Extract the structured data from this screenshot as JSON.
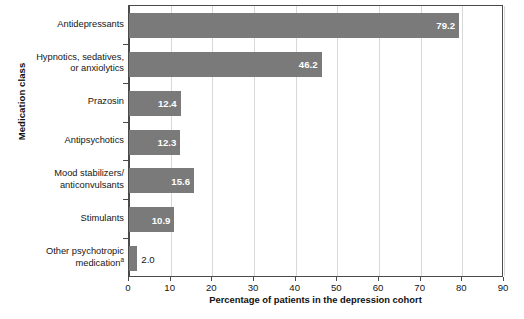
{
  "chart_data": {
    "type": "bar",
    "orientation": "horizontal",
    "title": "",
    "xlabel": "Percentage of patients in the depression cohort",
    "ylabel": "Medication class",
    "xlim": [
      0,
      90
    ],
    "xticks": [
      0,
      10,
      20,
      30,
      40,
      50,
      60,
      70,
      80,
      90
    ],
    "grid": "vertical",
    "legend": "none",
    "bar_color": "#7a7a7a",
    "categories": [
      "Antidepressants",
      "Hypnotics, sedatives, or anxiolytics",
      "Prazosin",
      "Antipsychotics",
      "Mood stabilizers/ anticonvulsants",
      "Stimulants",
      "Other psychotropic medication"
    ],
    "values": [
      79.2,
      46.2,
      12.4,
      12.3,
      15.6,
      10.9,
      2.0
    ],
    "value_labels": [
      "79.2",
      "46.2",
      "12.4",
      "12.3",
      "15.6",
      "10.9",
      "2.0"
    ],
    "bars": [
      {
        "category": "Antidepressants",
        "value": 79.2,
        "label": "79.2",
        "label_position": "inside"
      },
      {
        "category": "Hypnotics, sedatives, or anxiolytics",
        "value": 46.2,
        "label": "46.2",
        "label_position": "inside"
      },
      {
        "category": "Prazosin",
        "value": 12.4,
        "label": "12.4",
        "label_position": "inside"
      },
      {
        "category": "Antipsychotics",
        "value": 12.3,
        "label": "12.3",
        "label_position": "inside"
      },
      {
        "category": "Mood stabilizers/ anticonvulsants",
        "value": 15.6,
        "label": "15.6",
        "label_position": "inside"
      },
      {
        "category": "Stimulants",
        "value": 10.9,
        "label": "10.9",
        "label_position": "inside"
      },
      {
        "category": "Other psychotropic medication",
        "value": 2.0,
        "label": "2.0",
        "label_position": "outside"
      }
    ]
  },
  "axes": {
    "y_title": "Medication class",
    "x_title": "Percentage of patients in the depression cohort",
    "x_tick_labels": [
      "0",
      "10",
      "20",
      "30",
      "40",
      "50",
      "60",
      "70",
      "80",
      "90"
    ]
  },
  "category_labels": [
    {
      "lines": [
        "Antidepressants"
      ],
      "footnote_marker": ""
    },
    {
      "lines": [
        "Hypnotics, sedatives,",
        "or anxiolytics"
      ],
      "footnote_marker": ""
    },
    {
      "lines": [
        "Prazosin"
      ],
      "footnote_marker": ""
    },
    {
      "lines": [
        "Antipsychotics"
      ],
      "footnote_marker": ""
    },
    {
      "lines": [
        "Mood stabilizers/",
        "anticonvulsants"
      ],
      "footnote_marker": ""
    },
    {
      "lines": [
        "Stimulants"
      ],
      "footnote_marker": ""
    },
    {
      "lines": [
        "Other psychotropic",
        "medication"
      ],
      "footnote_marker": "a"
    }
  ],
  "footnote_partial": ""
}
